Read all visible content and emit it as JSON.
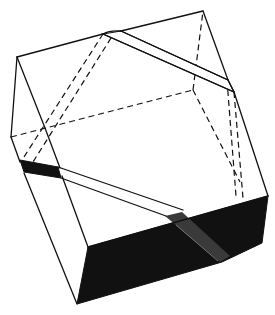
{
  "figure": {
    "title": "Cube with band wrapped diagonally around it",
    "colors": {
      "line": "#111111",
      "shaded_face": "#111111",
      "background": "#ffffff"
    },
    "elements": {
      "visible_edges": "solid lines",
      "hidden_edges": "dashed lines",
      "bottom_face": "dark stippled shading",
      "band": "diagonal strap crossing top, right and front faces"
    }
  }
}
